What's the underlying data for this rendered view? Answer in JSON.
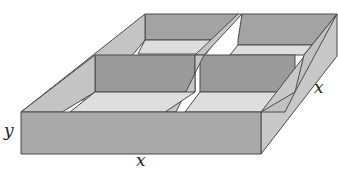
{
  "diagram": {
    "labels": {
      "height": "y",
      "front_width": "x",
      "side_depth": "x"
    },
    "colors": {
      "front_face": "#a9a9a9",
      "side_face": "#c8c8c8",
      "inner_wall": "#9e9e9e",
      "inner_floor": "#dcdcdc",
      "top_rim": "#bdbdbd",
      "edge": "#4a4a4a"
    }
  }
}
